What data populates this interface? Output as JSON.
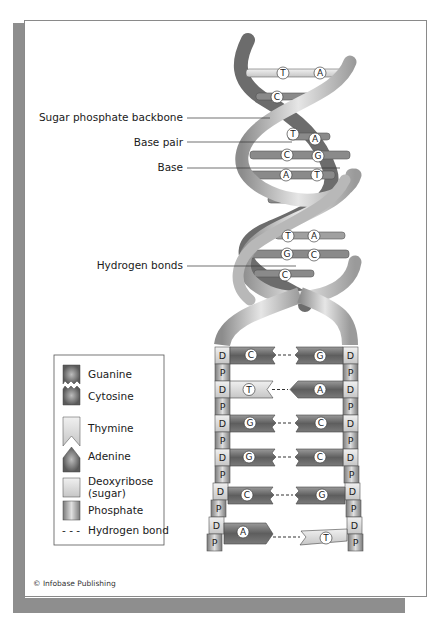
{
  "labels": {
    "sugar_phosphate_backbone": "Sugar phosphate backbone",
    "base_pair": "Base pair",
    "base": "Base",
    "hydrogen_bonds": "Hydrogen bonds"
  },
  "helix_pairs": [
    {
      "left": "T",
      "right": "A"
    },
    {
      "left": "C",
      "right": ""
    },
    {
      "left": "T",
      "right": "A"
    },
    {
      "left": "C",
      "right": "G"
    },
    {
      "left": "A",
      "right": "T"
    },
    {
      "left": "T",
      "right": "A"
    },
    {
      "left": "G",
      "right": "C"
    },
    {
      "left": "C",
      "right": ""
    }
  ],
  "ladder_rows": [
    {
      "left": "C",
      "right": "G",
      "left_sugar": "D",
      "right_sugar": "D"
    },
    {
      "left": "T",
      "right": "A",
      "left_sugar": "D",
      "right_sugar": "D"
    },
    {
      "left": "G",
      "right": "C",
      "left_sugar": "D",
      "right_sugar": "D"
    },
    {
      "left": "G",
      "right": "C",
      "left_sugar": "D",
      "right_sugar": "D"
    },
    {
      "left": "C",
      "right": "G",
      "left_sugar": "D",
      "right_sugar": "D"
    },
    {
      "left": "A",
      "right": "T",
      "left_sugar": "D",
      "right_sugar": "D"
    }
  ],
  "phosphate_label": "P",
  "deoxyribose_label": "D",
  "legend": {
    "items": [
      {
        "key": "guanine",
        "label": "Guanine"
      },
      {
        "key": "cytosine",
        "label": "Cytosine"
      },
      {
        "key": "thymine",
        "label": "Thymine"
      },
      {
        "key": "adenine",
        "label": "Adenine"
      },
      {
        "key": "deoxyribose",
        "label": "Deoxyribose",
        "label2": "(sugar)"
      },
      {
        "key": "phosphate",
        "label": "Phosphate"
      },
      {
        "key": "hydrogen_bond",
        "label": "Hydrogen bond",
        "symbol": "- - -"
      }
    ]
  },
  "copyright": "© Infobase Publishing",
  "colors": {
    "dark_base": "#6e6e6e",
    "light_base": "#d8d8d8",
    "backbone": "#c4c4c4",
    "backbone_dark": "#7a7a7a",
    "frame_shadow": "#8e8e8e"
  }
}
